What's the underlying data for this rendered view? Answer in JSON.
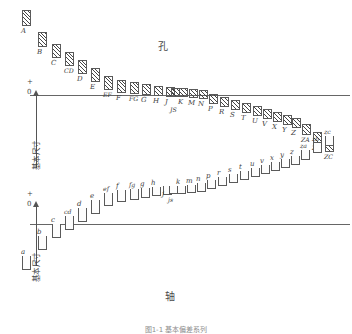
{
  "figure": {
    "caption": "图1-1 基本偏差系列",
    "axis_label": "基本尺寸",
    "plus_mark": "+",
    "zero_mark": "0",
    "minus_mark": "-"
  },
  "hole": {
    "title": "孔",
    "zone_style": "hatched",
    "zones": [
      {
        "label": "A",
        "x": 22,
        "top": 10,
        "height": 16
      },
      {
        "label": "B",
        "x": 38,
        "top": 32,
        "height": 15
      },
      {
        "label": "C",
        "x": 52,
        "top": 44,
        "height": 14
      },
      {
        "label": "CD",
        "x": 65,
        "top": 52,
        "height": 14
      },
      {
        "label": "D",
        "x": 78,
        "top": 60,
        "height": 14
      },
      {
        "label": "E",
        "x": 91,
        "top": 68,
        "height": 14
      },
      {
        "label": "EF",
        "x": 104,
        "top": 76,
        "height": 14
      },
      {
        "label": "F",
        "x": 117,
        "top": 80,
        "height": 13
      },
      {
        "label": "FG",
        "x": 130,
        "top": 82,
        "height": 12
      },
      {
        "label": "G",
        "x": 142,
        "top": 84,
        "height": 11
      },
      {
        "label": "H",
        "x": 154,
        "top": 86,
        "height": 10
      },
      {
        "label": "J",
        "x": 166,
        "top": 87,
        "height": 10
      },
      {
        "label": "JS",
        "x": 171,
        "top": 88,
        "height": 9
      },
      {
        "label": "K",
        "x": 179,
        "top": 88,
        "height": 9
      },
      {
        "label": "M",
        "x": 189,
        "top": 89,
        "height": 9
      },
      {
        "label": "N",
        "x": 199,
        "top": 90,
        "height": 9
      },
      {
        "label": "P",
        "x": 209,
        "top": 94,
        "height": 10
      },
      {
        "label": "R",
        "x": 220,
        "top": 97,
        "height": 10
      },
      {
        "label": "S",
        "x": 231,
        "top": 100,
        "height": 10
      },
      {
        "label": "T",
        "x": 242,
        "top": 103,
        "height": 10
      },
      {
        "label": "U",
        "x": 253,
        "top": 106,
        "height": 10
      },
      {
        "label": "V",
        "x": 263,
        "top": 109,
        "height": 10
      },
      {
        "label": "X",
        "x": 273,
        "top": 112,
        "height": 10
      },
      {
        "label": "Y",
        "x": 283,
        "top": 115,
        "height": 10
      },
      {
        "label": "Z",
        "x": 292,
        "top": 118,
        "height": 10
      },
      {
        "label": "ZA",
        "x": 302,
        "top": 124,
        "height": 11
      },
      {
        "label": "ZB",
        "x": 313,
        "top": 132,
        "height": 11
      },
      {
        "label": "ZC",
        "x": 325,
        "top": 140,
        "height": 12
      }
    ]
  },
  "shaft": {
    "title": "轴",
    "zone_style": "open",
    "zones": [
      {
        "label": "a",
        "x": 22,
        "bottom": 2,
        "height": 14
      },
      {
        "label": "b",
        "x": 38,
        "bottom": 22,
        "height": 14
      },
      {
        "label": "c",
        "x": 52,
        "bottom": 34,
        "height": 14
      },
      {
        "label": "cd",
        "x": 65,
        "bottom": 42,
        "height": 14
      },
      {
        "label": "d",
        "x": 78,
        "bottom": 50,
        "height": 14
      },
      {
        "label": "e",
        "x": 91,
        "bottom": 58,
        "height": 14
      },
      {
        "label": "ef",
        "x": 104,
        "bottom": 66,
        "height": 13
      },
      {
        "label": "f",
        "x": 117,
        "bottom": 70,
        "height": 12
      },
      {
        "label": "fg",
        "x": 130,
        "bottom": 72,
        "height": 11
      },
      {
        "label": "g",
        "x": 141,
        "bottom": 74,
        "height": 10
      },
      {
        "label": "h",
        "x": 152,
        "bottom": 76,
        "height": 9
      },
      {
        "label": "j",
        "x": 163,
        "bottom": 77,
        "height": 9
      },
      {
        "label": "js",
        "x": 169,
        "bottom": 78,
        "height": 8
      },
      {
        "label": "k",
        "x": 177,
        "bottom": 78,
        "height": 8
      },
      {
        "label": "m",
        "x": 187,
        "bottom": 79,
        "height": 8
      },
      {
        "label": "n",
        "x": 197,
        "bottom": 80,
        "height": 9
      },
      {
        "label": "p",
        "x": 207,
        "bottom": 83,
        "height": 9
      },
      {
        "label": "r",
        "x": 218,
        "bottom": 86,
        "height": 9
      },
      {
        "label": "s",
        "x": 229,
        "bottom": 89,
        "height": 9
      },
      {
        "label": "t",
        "x": 240,
        "bottom": 92,
        "height": 9
      },
      {
        "label": "u",
        "x": 251,
        "bottom": 95,
        "height": 9
      },
      {
        "label": "v",
        "x": 261,
        "bottom": 98,
        "height": 9
      },
      {
        "label": "x",
        "x": 271,
        "bottom": 101,
        "height": 9
      },
      {
        "label": "y",
        "x": 281,
        "bottom": 104,
        "height": 9
      },
      {
        "label": "z",
        "x": 291,
        "bottom": 107,
        "height": 9
      },
      {
        "label": "za",
        "x": 301,
        "bottom": 112,
        "height": 10
      },
      {
        "label": "zb",
        "x": 313,
        "bottom": 119,
        "height": 10
      },
      {
        "label": "zc",
        "x": 325,
        "bottom": 126,
        "height": 10
      }
    ]
  }
}
